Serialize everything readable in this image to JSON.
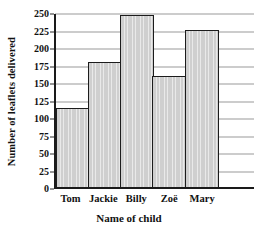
{
  "chart_data": {
    "type": "bar",
    "title": "",
    "xlabel": "Name of child",
    "ylabel": "Number of leaflets delivered",
    "categories": [
      "Tom",
      "Jackie",
      "Billy",
      "Zoë",
      "Mary"
    ],
    "values": [
      115,
      181,
      249,
      160,
      227
    ],
    "ylim": [
      0,
      250
    ],
    "ytick_labels": [
      "0",
      "25",
      "50",
      "75",
      "100",
      "125",
      "150",
      "175",
      "200",
      "225",
      "250"
    ],
    "ytick_values": [
      0,
      25,
      50,
      75,
      100,
      125,
      150,
      175,
      200,
      225,
      250
    ],
    "grid": true,
    "grid_axis": "y",
    "legend": false,
    "legend_position": "none",
    "bar_gap": 0,
    "colors": {
      "bar_fill": "#cfcfcf",
      "bar_border": "#1c1c1c",
      "gridline": "#9a9a9a",
      "axis": "#1a1a1a",
      "text": "#111111",
      "background": "#ffffff"
    }
  }
}
